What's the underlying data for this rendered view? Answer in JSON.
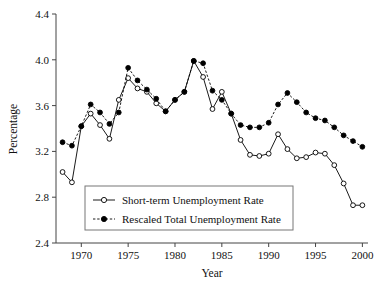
{
  "chart_data": {
    "type": "line",
    "title": "",
    "subtitle": "",
    "xlabel": "Year",
    "ylabel": "Percentage",
    "xlim": [
      1967.3,
      2000.6
    ],
    "ylim": [
      2.4,
      4.4
    ],
    "grid": false,
    "legend_position": "inside-bottom-left",
    "xticks": [
      1970,
      1975,
      1980,
      1985,
      1990,
      1995,
      2000
    ],
    "xtick_labels": [
      "1970",
      "1975",
      "1980",
      "1985",
      "1990",
      "1995",
      "2000"
    ],
    "yticks": [
      2.4,
      2.8,
      3.2,
      3.6,
      4.0,
      4.4
    ],
    "ytick_labels": [
      "2.4",
      "2.8",
      "3.2",
      "3.6",
      "4.0",
      "4.4"
    ],
    "x": [
      1968,
      1969,
      1970,
      1971,
      1972,
      1973,
      1974,
      1975,
      1976,
      1977,
      1978,
      1979,
      1980,
      1981,
      1982,
      1983,
      1984,
      1985,
      1986,
      1987,
      1988,
      1989,
      1990,
      1991,
      1992,
      1993,
      1994,
      1995,
      1996,
      1997,
      1998,
      1999,
      2000
    ],
    "series": [
      {
        "name": "Short-term Unemployment Rate",
        "marker": "open-circle",
        "line_style": "solid",
        "color": "#000000",
        "values": [
          3.02,
          2.93,
          3.42,
          3.53,
          3.43,
          3.31,
          3.65,
          3.84,
          3.75,
          3.72,
          3.62,
          3.55,
          3.65,
          3.72,
          3.99,
          3.85,
          3.57,
          3.72,
          3.53,
          3.3,
          3.17,
          3.16,
          3.18,
          3.35,
          3.22,
          3.14,
          3.15,
          3.19,
          3.18,
          3.08,
          2.92,
          2.73,
          2.73
        ]
      },
      {
        "name": "Rescaled Total Unemployment Rate",
        "marker": "filled-circle",
        "line_style": "dashed",
        "color": "#000000",
        "values": [
          3.28,
          3.25,
          3.42,
          3.61,
          3.54,
          3.44,
          3.54,
          3.93,
          3.82,
          3.74,
          3.66,
          3.55,
          3.65,
          3.72,
          3.99,
          3.97,
          3.73,
          3.65,
          3.53,
          3.43,
          3.41,
          3.41,
          3.45,
          3.61,
          3.71,
          3.63,
          3.54,
          3.49,
          3.47,
          3.41,
          3.34,
          3.29,
          3.24
        ]
      }
    ],
    "legend": [
      {
        "label": "Short-term Unemployment Rate",
        "marker": "open-circle",
        "line_style": "solid"
      },
      {
        "label": "Rescaled Total Unemployment Rate",
        "marker": "filled-circle",
        "line_style": "dashed"
      }
    ]
  }
}
